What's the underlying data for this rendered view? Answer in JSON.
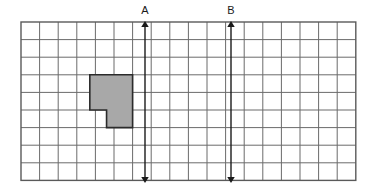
{
  "figure": {
    "type": "grid-diagram",
    "title": "",
    "background_color": "#ffffff",
    "width": 374,
    "height": 195
  },
  "grid": {
    "name": "square-grid",
    "columns": 18,
    "rows": 9,
    "x": 21,
    "y": 22,
    "cell_width": 18.6,
    "cell_height": 17.6,
    "line_color": "#6b6b6b",
    "border_color": "#5a5a5a",
    "line_width": 1,
    "border_width": 1.4
  },
  "shape": {
    "name": "shaded-polygon",
    "description": "notched L-shaped hexagon shaded gray",
    "fill_color": "#a8a8a8",
    "stroke_color": "#2b2b2b",
    "stroke_width": 1.6,
    "grid_vertices": [
      [
        3.7,
        3
      ],
      [
        6,
        3
      ],
      [
        6,
        6
      ],
      [
        4.6,
        6
      ],
      [
        4.6,
        5
      ],
      [
        3.7,
        5
      ]
    ],
    "points": "90,75 133,75 133,128 107,128 107,110 90,110"
  },
  "arrows": [
    {
      "name": "arrow-a",
      "label": "A",
      "label_x": 145,
      "label_y": 14,
      "x": 145,
      "y_top": 24,
      "y_bottom": 180,
      "color": "#1a1a1a",
      "line_width": 1.4,
      "double_headed": true,
      "grid_column_boundary": 6.67
    },
    {
      "name": "arrow-b",
      "label": "B",
      "label_x": 231,
      "label_y": 14,
      "x": 231,
      "y_top": 24,
      "y_bottom": 180,
      "color": "#1a1a1a",
      "line_width": 1.4,
      "double_headed": true,
      "grid_column_boundary": 11.29
    }
  ]
}
